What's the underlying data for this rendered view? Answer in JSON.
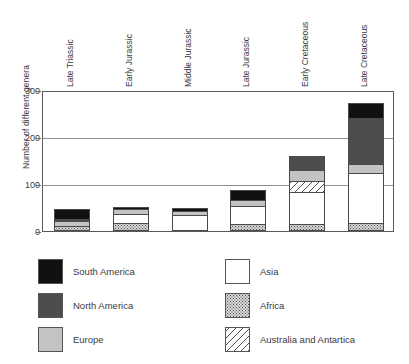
{
  "chart_data": {
    "type": "bar",
    "subtype": "stacked",
    "title": "",
    "xlabel": "",
    "ylabel": "Number of different genera",
    "ylim": [
      0,
      300
    ],
    "yticks": [
      0,
      100,
      200,
      300
    ],
    "ytick_labels": [
      "0",
      "100",
      "200",
      "300"
    ],
    "grid": true,
    "grid_axis": "y",
    "legend_position": "below-plot-two-columns",
    "categories": [
      "Late Triassic",
      "Early Jurassic",
      "Middle Jurassic",
      "Late Jurassic",
      "Early Cretaceous",
      "Late Cretaceous"
    ],
    "series": [
      {
        "name": "Africa",
        "color": "#d8d8d8",
        "pattern": "stipple",
        "values": [
          8,
          13,
          0,
          12,
          12,
          12
        ]
      },
      {
        "name": "Asia",
        "color": "#ffffff",
        "pattern": "solid",
        "values": [
          0,
          22,
          33,
          40,
          70,
          110
        ]
      },
      {
        "name": "Australia and Antartica",
        "color": "#ffffff",
        "pattern": "diagonal-hatch",
        "values": [
          0,
          0,
          0,
          0,
          23,
          0
        ]
      },
      {
        "name": "Europe",
        "color": "#c3c3c3",
        "pattern": "solid",
        "values": [
          10,
          11,
          8,
          13,
          25,
          18
        ]
      },
      {
        "name": "North America",
        "color": "#4d4d4d",
        "pattern": "solid",
        "values": [
          6,
          0,
          0,
          0,
          30,
          100
        ]
      },
      {
        "name": "South America",
        "color": "#111111",
        "pattern": "solid",
        "values": [
          23,
          6,
          9,
          22,
          0,
          32
        ]
      }
    ],
    "totals": [
      47,
      52,
      50,
      87,
      160,
      272
    ]
  },
  "axis": {
    "y_title": "Number of different genera",
    "y_ticks": [
      "300",
      "200",
      "100",
      "0"
    ]
  },
  "legend": {
    "left": [
      {
        "label": "South America",
        "fill": "f-south-america"
      },
      {
        "label": "North America",
        "fill": "f-north-america"
      },
      {
        "label": "Europe",
        "fill": "f-europe"
      }
    ],
    "right": [
      {
        "label": "Asia",
        "fill": "f-asia"
      },
      {
        "label": "Africa",
        "fill": "f-africa"
      },
      {
        "label": "Australia and Antartica",
        "fill": "f-australia"
      }
    ]
  }
}
